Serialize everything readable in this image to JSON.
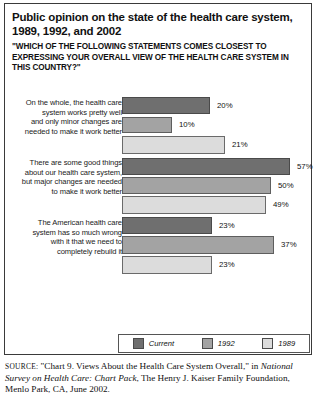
{
  "title": "Public opinion on the state of the health care system, 1989, 1992, and 2002",
  "subtitle": "\"WHICH OF THE FOLLOWING STATEMENTS COMES CLOSEST TO EXPRESSING YOUR OVERALL VIEW OF THE HEALTH CARE SYSTEM IN THIS COUNTRY?\"",
  "legend": {
    "items": [
      {
        "label": "Current",
        "color": "#6f6f6f"
      },
      {
        "label": "1992",
        "color": "#a3a3a3"
      },
      {
        "label": "1989",
        "color": "#dcdcdc"
      }
    ]
  },
  "source": {
    "prefix": "SOURCE:",
    "quote": "\"Chart 9. Views About the Health Care System Overall,\"",
    "connector": "in",
    "publication": "National Survey on Health Care: Chart Pack",
    "rest": ", The Henry J. Kaiser Family",
    "line3": "Foundation, Menlo Park, CA, June 2002."
  },
  "chart_data": {
    "type": "bar",
    "orientation": "horizontal",
    "title": "Public opinion on the state of the health care system, 1989, 1992, and 2002",
    "subtitle": "\"WHICH OF THE FOLLOWING STATEMENTS COMES CLOSEST TO EXPRESSING YOUR OVERALL VIEW OF THE HEALTH CARE SYSTEM IN THIS COUNTRY?\"",
    "xlabel": "",
    "ylabel": "",
    "grid": false,
    "legend_position": "bottom",
    "categories": [
      "On the whole, the health care system works pretty well and only minor changes are needed to make it work better",
      "There are some good things about our health care system, but major changes are needed to make it work better",
      "The American health care system has so much wrong with it that we need to completely rebuild it"
    ],
    "series": [
      {
        "name": "Current",
        "color": "#6f6f6f",
        "values": [
          20,
          57,
          23
        ],
        "labels": [
          "20%",
          "57%",
          "23%"
        ]
      },
      {
        "name": "1992",
        "color": "#a3a3a3",
        "values": [
          10,
          50,
          37
        ],
        "labels": [
          "10%",
          "50%",
          "37%"
        ]
      },
      {
        "name": "1989",
        "color": "#dcdcdc",
        "values": [
          21,
          49,
          23
        ],
        "labels": [
          "21%",
          "49%",
          "23%"
        ]
      }
    ]
  },
  "groups": [
    {
      "label_lines": [
        "On the whole, the health care",
        "system works pretty well",
        "and only minor changes are",
        "needed to make it work better"
      ],
      "bars": [
        {
          "series": "Current",
          "label": "20%",
          "px_width": 88,
          "px_top": 3,
          "px_height": 17
        },
        {
          "series": "1992",
          "label": "10%",
          "px_width": 50,
          "px_top": 23,
          "px_height": 16
        },
        {
          "series": "1989",
          "label": "21%",
          "px_width": 103,
          "px_top": 42,
          "px_height": 18
        }
      ]
    },
    {
      "label_lines": [
        "There are some good things",
        "about our health care system,",
        "but major changes are needed",
        "to make it work better"
      ],
      "bars": [
        {
          "series": "Current",
          "label": "57%",
          "px_width": 168,
          "px_top": 2,
          "px_height": 17
        },
        {
          "series": "1992",
          "label": "50%",
          "px_width": 149,
          "px_top": 21,
          "px_height": 17
        },
        {
          "series": "1989",
          "label": "49%",
          "px_width": 144,
          "px_top": 40,
          "px_height": 18
        }
      ]
    },
    {
      "label_lines": [
        "The American health care",
        "system has so much wrong",
        "with it that we need to",
        "completely rebuild it"
      ],
      "bars": [
        {
          "series": "Current",
          "label": "23%",
          "px_width": 90,
          "px_top": 3,
          "px_height": 17
        },
        {
          "series": "1992",
          "label": "37%",
          "px_width": 152,
          "px_top": 22,
          "px_height": 18
        },
        {
          "series": "1989",
          "label": "23%",
          "px_width": 90,
          "px_top": 42,
          "px_height": 18
        }
      ]
    }
  ]
}
